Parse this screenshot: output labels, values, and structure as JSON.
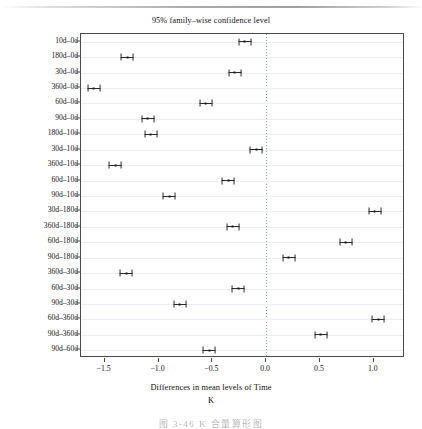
{
  "chart_data": {
    "type": "scatter",
    "title": "95% family–wise confidence level",
    "xlabel": "Differences in mean levels of Time",
    "sublabel": "K",
    "ylabel": "",
    "xlim": [
      -1.72,
      1.29
    ],
    "ylim_categories": 21,
    "grid": true,
    "legend": null,
    "reference_line": 0.0,
    "xticks": [
      -1.5,
      -1.0,
      -0.5,
      0.0,
      0.5,
      1.0
    ],
    "xtick_labels": [
      "−1.5",
      "−1.0",
      "−0.5",
      "0.0",
      "0.5",
      "1.0"
    ],
    "categories": [
      "10d–0d",
      "180d–0d",
      "30d–0d",
      "360d–0d",
      "60d–0d",
      "90d–0d",
      "180d–10d",
      "30d–10d",
      "360d–10d",
      "60d–10d",
      "90d–10d",
      "30d–180d",
      "360d–180d",
      "60d–180d",
      "90d–180d",
      "360d–30d",
      "60d–30d",
      "90d–30d",
      "60d–360d",
      "90d–360d",
      "90d–60d"
    ],
    "points": [
      {
        "category": "10d–0d",
        "diff": -0.2,
        "lower": -0.26,
        "upper": -0.14
      },
      {
        "category": "180d–0d",
        "diff": -1.29,
        "lower": -1.35,
        "upper": -1.23
      },
      {
        "category": "30d–0d",
        "diff": -0.29,
        "lower": -0.35,
        "upper": -0.23
      },
      {
        "category": "360d–0d",
        "diff": -1.6,
        "lower": -1.66,
        "upper": -1.54
      },
      {
        "category": "60d–0d",
        "diff": -0.56,
        "lower": -0.62,
        "upper": -0.5
      },
      {
        "category": "90d–0d",
        "diff": -1.1,
        "lower": -1.16,
        "upper": -1.04
      },
      {
        "category": "180d–10d",
        "diff": -1.07,
        "lower": -1.13,
        "upper": -1.01
      },
      {
        "category": "30d–10d",
        "diff": -0.09,
        "lower": -0.15,
        "upper": -0.03
      },
      {
        "category": "360d–10d",
        "diff": -1.4,
        "lower": -1.46,
        "upper": -1.34
      },
      {
        "category": "60d–10d",
        "diff": -0.35,
        "lower": -0.41,
        "upper": -0.29
      },
      {
        "category": "90d–10d",
        "diff": -0.9,
        "lower": -0.96,
        "upper": -0.84
      },
      {
        "category": "30d–180d",
        "diff": 1.01,
        "lower": 0.95,
        "upper": 1.07
      },
      {
        "category": "360d–180d",
        "diff": -0.31,
        "lower": -0.37,
        "upper": -0.25
      },
      {
        "category": "60d–180d",
        "diff": 0.74,
        "lower": 0.68,
        "upper": 0.8
      },
      {
        "category": "90d–180d",
        "diff": 0.21,
        "lower": 0.15,
        "upper": 0.27
      },
      {
        "category": "360d–30d",
        "diff": -1.3,
        "lower": -1.36,
        "upper": -1.24
      },
      {
        "category": "60d–30d",
        "diff": -0.26,
        "lower": -0.32,
        "upper": -0.2
      },
      {
        "category": "90d–30d",
        "diff": -0.8,
        "lower": -0.86,
        "upper": -0.74
      },
      {
        "category": "60d–360d",
        "diff": 1.04,
        "lower": 0.98,
        "upper": 1.1
      },
      {
        "category": "90d–360d",
        "diff": 0.51,
        "lower": 0.45,
        "upper": 0.57
      },
      {
        "category": "90d–60d",
        "diff": -0.53,
        "lower": -0.59,
        "upper": -0.47
      }
    ]
  },
  "caption": {
    "text": "图 3-46  K 合量算形图"
  }
}
